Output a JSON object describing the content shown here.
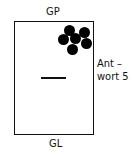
{
  "diagram": {
    "top_label": "GP",
    "bottom_label": "GL",
    "side_label_line1": "Ant –",
    "side_label_line2": "wort 5",
    "dots": [
      {
        "x": 69,
        "y": 30
      },
      {
        "x": 84,
        "y": 32
      },
      {
        "x": 63,
        "y": 39
      },
      {
        "x": 75,
        "y": 38
      },
      {
        "x": 86,
        "y": 43
      },
      {
        "x": 72,
        "y": 49
      }
    ],
    "colors": {
      "stroke": "#111111",
      "dot": "#000000",
      "background": "#ffffff"
    }
  }
}
